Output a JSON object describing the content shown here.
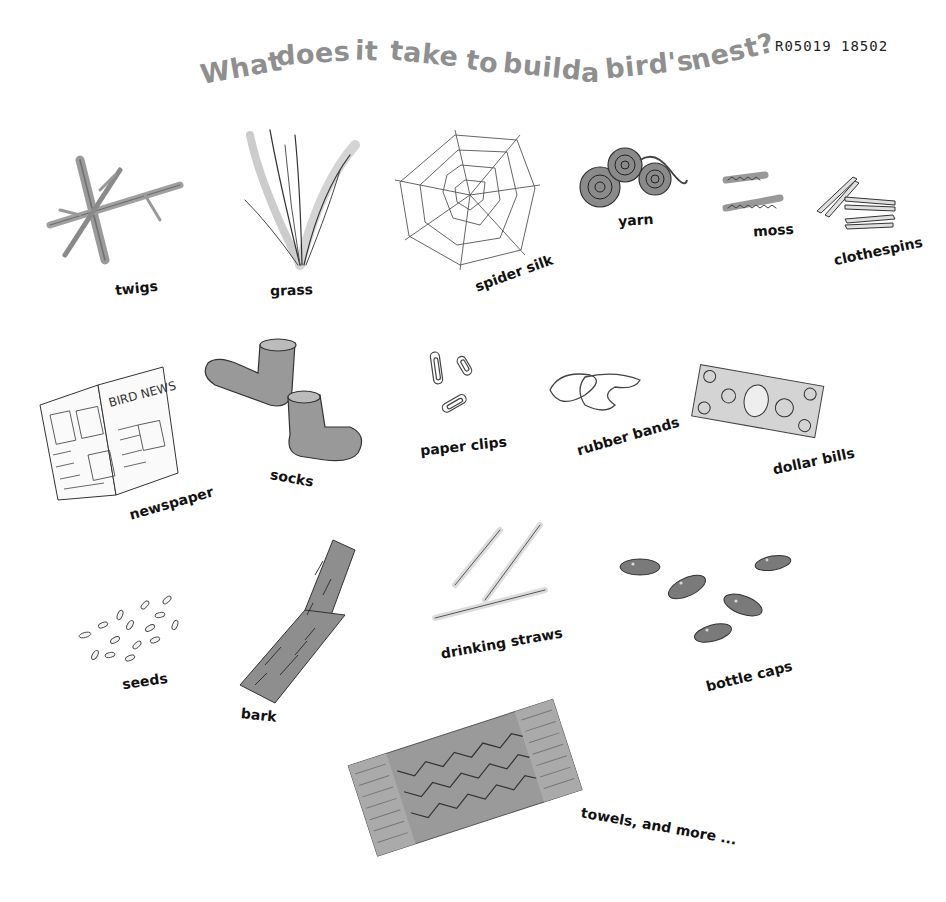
{
  "title": {
    "text": "What does it take to build a bird's nest?",
    "words": [
      "What",
      "does",
      "it",
      "take",
      "to",
      "build",
      "a",
      "bird's",
      "nest?"
    ],
    "color": "#8f8f8f"
  },
  "code": "R05019 18502",
  "items": [
    {
      "label": "twigs",
      "icon": "twigs-icon"
    },
    {
      "label": "grass",
      "icon": "grass-icon"
    },
    {
      "label": "spider silk",
      "icon": "spider-web-icon"
    },
    {
      "label": "yarn",
      "icon": "yarn-icon"
    },
    {
      "label": "moss",
      "icon": "moss-icon"
    },
    {
      "label": "clothespins",
      "icon": "clothespins-icon"
    },
    {
      "label": "newspaper",
      "icon": "newspaper-icon",
      "headline": "BIRD NEWS"
    },
    {
      "label": "socks",
      "icon": "socks-icon"
    },
    {
      "label": "paper clips",
      "icon": "paper-clips-icon"
    },
    {
      "label": "rubber bands",
      "icon": "rubber-bands-icon"
    },
    {
      "label": "dollar bills",
      "icon": "dollar-bill-icon"
    },
    {
      "label": "seeds",
      "icon": "seeds-icon"
    },
    {
      "label": "bark",
      "icon": "bark-icon"
    },
    {
      "label": "drinking straws",
      "icon": "drinking-straws-icon"
    },
    {
      "label": "bottle caps",
      "icon": "bottle-caps-icon"
    },
    {
      "label": "towels, and more ...",
      "icon": "towel-icon"
    }
  ]
}
